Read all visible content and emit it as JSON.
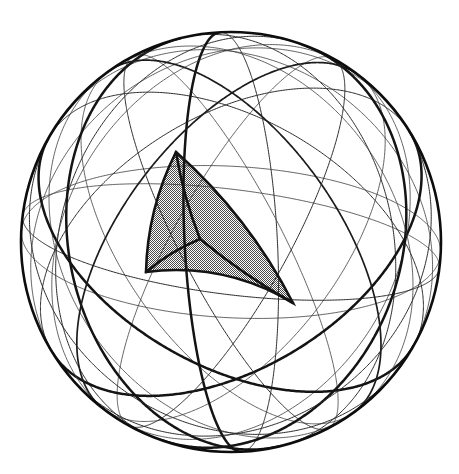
{
  "figure": {
    "kind": "geometric-illustration",
    "background_color": "#ffffff",
    "line_color": "#141414",
    "shade_color": "#999999",
    "shade_pattern": "50% checkerboard dither",
    "canvas": {
      "width": 459,
      "height": 474
    }
  },
  "sphere": {
    "center_x": 231,
    "center_y": 242,
    "radius": 210,
    "outline_stroke_width": 2.6,
    "outline_color": "#0d0d0d"
  },
  "great_circles": [
    {
      "name": "equator-tilted-front",
      "axis": [
        0.12,
        0.96,
        0.25
      ],
      "weight": "thin"
    },
    {
      "name": "equator-tilted-mid",
      "axis": [
        0.05,
        0.93,
        -0.36
      ],
      "weight": "hair"
    },
    {
      "name": "meridian-primary",
      "axis": [
        0.97,
        0.05,
        0.22
      ],
      "weight": "thick"
    },
    {
      "name": "meridian-secondary",
      "axis": [
        0.62,
        0.15,
        0.77
      ],
      "weight": "thick"
    },
    {
      "name": "meridian-tertiary",
      "axis": [
        -0.55,
        0.2,
        0.81
      ],
      "weight": "thick"
    },
    {
      "name": "oblique-circle-a",
      "axis": [
        0.4,
        0.7,
        0.59
      ],
      "weight": "thick"
    },
    {
      "name": "oblique-circle-b",
      "axis": [
        -0.42,
        0.68,
        0.6
      ],
      "weight": "thick"
    },
    {
      "name": "oblique-circle-c",
      "axis": [
        0.7,
        0.5,
        -0.51
      ],
      "weight": "med"
    },
    {
      "name": "oblique-circle-d",
      "axis": [
        -0.68,
        0.52,
        -0.52
      ],
      "weight": "med"
    },
    {
      "name": "oblique-circle-e",
      "axis": [
        0.28,
        0.4,
        0.87
      ],
      "weight": "thin"
    },
    {
      "name": "oblique-circle-f",
      "axis": [
        -0.3,
        0.38,
        0.87
      ],
      "weight": "thin"
    },
    {
      "name": "oblique-circle-g",
      "axis": [
        0.86,
        0.45,
        0.24
      ],
      "weight": "thin"
    },
    {
      "name": "oblique-circle-h",
      "axis": [
        -0.84,
        0.47,
        0.27
      ],
      "weight": "thin"
    },
    {
      "name": "oblique-circle-i",
      "axis": [
        0.52,
        -0.34,
        0.78
      ],
      "weight": "hair"
    },
    {
      "name": "oblique-circle-j",
      "axis": [
        -0.5,
        -0.36,
        0.79
      ],
      "weight": "hair"
    }
  ],
  "shaded_triangle": {
    "name": "fundamental-domain",
    "fill_color": "#999999",
    "vertices": [
      {
        "label": "top-vertex",
        "x": 176,
        "y": 152
      },
      {
        "label": "left-vertex",
        "x": 146,
        "y": 272
      },
      {
        "label": "bottom-right-vertex",
        "x": 293,
        "y": 303
      }
    ],
    "interior_point": {
      "label": "incenter-node",
      "x": 200,
      "y": 239
    },
    "subdivision_count": 3,
    "edge_bulge": {
      "top_to_left": 7,
      "left_to_bottomright": -13,
      "bottomright_to_top": 9
    }
  },
  "labels": {
    "caption": ""
  }
}
